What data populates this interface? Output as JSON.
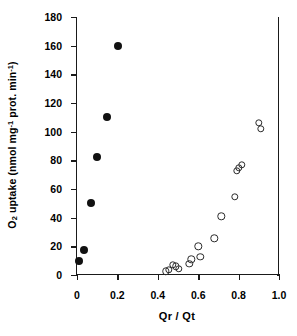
{
  "chart_data": {
    "type": "scatter",
    "title": "",
    "xlabel": "Qr / Qt",
    "ylabel_text": "O2 uptake (nmol mg-1 prot. min-1)",
    "ylabel_parts": {
      "lead": "O",
      "sub": "2",
      "mid": " uptake (nmol mg",
      "sup1": "-1",
      "mid2": " prot. min",
      "sup2": "-1",
      "tail": ")"
    },
    "xlim": [
      0,
      1.0
    ],
    "ylim": [
      0,
      180
    ],
    "xticks": [
      0,
      0.2,
      0.4,
      0.6,
      0.8,
      1.0
    ],
    "xticklabels": [
      "0",
      "0.2",
      "0.4",
      "0.6",
      "0.8",
      "1.0"
    ],
    "yticks": [
      0,
      20,
      40,
      60,
      80,
      100,
      120,
      140,
      160,
      180
    ],
    "yticklabels": [
      "0",
      "20",
      "40",
      "60",
      "80",
      "100",
      "120",
      "140",
      "160",
      "180"
    ],
    "grid": false,
    "legend": "none",
    "series": [
      {
        "name": "filled-circles",
        "marker": "filled-circle",
        "color": "#111111",
        "points": [
          [
            0.01,
            10.0
          ],
          [
            0.035,
            17.5
          ],
          [
            0.07,
            50.0
          ],
          [
            0.1,
            82.5
          ],
          [
            0.15,
            110.5
          ],
          [
            0.205,
            159.5
          ]
        ]
      },
      {
        "name": "open-circles",
        "marker": "open-circle",
        "color": "#2b2b2b",
        "points": [
          [
            0.44,
            2.5
          ],
          [
            0.455,
            3.5
          ],
          [
            0.475,
            7.0
          ],
          [
            0.49,
            6.0
          ],
          [
            0.505,
            4.5
          ],
          [
            0.555,
            8.0
          ],
          [
            0.565,
            11.0
          ],
          [
            0.6,
            20.0
          ],
          [
            0.61,
            12.5
          ],
          [
            0.68,
            25.5
          ],
          [
            0.715,
            41.0
          ],
          [
            0.78,
            54.5
          ],
          [
            0.79,
            72.5
          ],
          [
            0.8,
            75.0
          ],
          [
            0.815,
            77.0
          ],
          [
            0.9,
            106.0
          ],
          [
            0.91,
            102.0
          ]
        ]
      }
    ]
  }
}
